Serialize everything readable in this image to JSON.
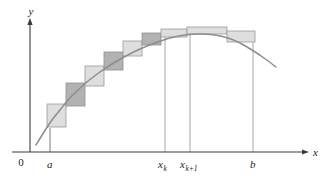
{
  "figure": {
    "name": "riemann-sum-rectangles-under-curve",
    "background_color": "#ffffff",
    "width": 327,
    "height": 183
  },
  "axes": {
    "y_axis_label": "y",
    "x_axis_label": "x",
    "origin_label": "0",
    "axis_color": "#3a3a3a",
    "y_axis_x": 30,
    "y_axis_top": 22,
    "x_axis_y": 152,
    "x_axis_right": 305
  },
  "tick_labels": [
    {
      "id": "a",
      "base": "a",
      "sub": "",
      "x_px": 50,
      "label_x": 47,
      "label_y": 168
    },
    {
      "id": "xk",
      "base": "x",
      "sub": "k",
      "x_px": 165,
      "label_x": 158,
      "label_y": 168
    },
    {
      "id": "xk1",
      "base": "x",
      "sub": "k+1",
      "x_px": 190,
      "label_x": 180,
      "label_y": 168
    },
    {
      "id": "b",
      "base": "b",
      "sub": "",
      "x_px": 253,
      "label_x": 250,
      "label_y": 168
    }
  ],
  "colors": {
    "rect_light_fill": "#dedede",
    "rect_dark_fill": "#b2b2b2",
    "rect_stroke": "#9a9a9a",
    "curve_stroke": "#8d8d8d",
    "drop_line": "#9b9b9b"
  },
  "chart_data": {
    "type": "area",
    "title": "",
    "subtitle": "",
    "xlabel": "x",
    "ylabel": "y",
    "grid": false,
    "legend": null,
    "annotations": [
      "a",
      "x_k",
      "x_{k+1}",
      "b"
    ],
    "xlim": [
      30,
      305
    ],
    "ylim": [
      152,
      22
    ],
    "curve_points": [
      [
        36,
        145
      ],
      [
        44,
        132
      ],
      [
        52,
        120
      ],
      [
        60,
        110
      ],
      [
        68,
        100
      ],
      [
        78,
        90
      ],
      [
        88,
        81
      ],
      [
        100,
        72
      ],
      [
        112,
        64
      ],
      [
        126,
        56
      ],
      [
        140,
        49
      ],
      [
        155,
        43
      ],
      [
        170,
        38
      ],
      [
        185,
        35
      ],
      [
        200,
        34
      ],
      [
        215,
        35
      ],
      [
        228,
        38
      ],
      [
        240,
        43
      ],
      [
        252,
        50
      ],
      [
        264,
        58
      ],
      [
        276,
        67
      ]
    ],
    "rectangles": [
      {
        "index": 1,
        "x": 47,
        "y": 104,
        "w": 19,
        "h": 23,
        "shade": "light"
      },
      {
        "index": 2,
        "x": 66,
        "y": 83,
        "w": 19,
        "h": 23,
        "shade": "dark"
      },
      {
        "index": 3,
        "x": 85,
        "y": 66,
        "w": 19,
        "h": 20,
        "shade": "light"
      },
      {
        "index": 4,
        "x": 104,
        "y": 52,
        "w": 19,
        "h": 18,
        "shade": "dark"
      },
      {
        "index": 5,
        "x": 123,
        "y": 41,
        "w": 19,
        "h": 15,
        "shade": "light"
      },
      {
        "index": 6,
        "x": 142,
        "y": 33,
        "w": 19,
        "h": 12,
        "shade": "dark"
      },
      {
        "index": 7,
        "x": 161,
        "y": 29,
        "w": 26,
        "h": 8,
        "shade": "light"
      },
      {
        "index": 8,
        "x": 187,
        "y": 27,
        "w": 40,
        "h": 7,
        "shade": "light"
      },
      {
        "index": 9,
        "x": 227,
        "y": 31,
        "w": 28,
        "h": 11,
        "shade": "light"
      }
    ],
    "drop_lines": [
      {
        "label": "x_k",
        "x": 165,
        "y_top": 37,
        "y_bottom": 152
      },
      {
        "label": "x_{k+1}",
        "x": 190,
        "y_top": 34,
        "y_bottom": 152
      },
      {
        "label": "b",
        "x": 253,
        "y_top": 42,
        "y_bottom": 152
      }
    ],
    "short_ticks": [
      {
        "label": "a",
        "x": 50,
        "y_top": 128,
        "y_bottom": 152
      }
    ]
  }
}
